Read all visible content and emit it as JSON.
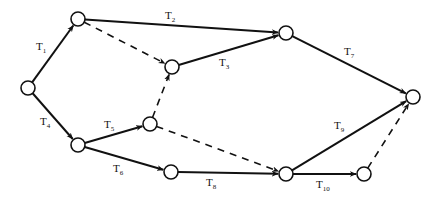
{
  "diagram": {
    "type": "activity-network",
    "nodes": [
      {
        "id": "n1",
        "x": 28,
        "y": 88
      },
      {
        "id": "n2",
        "x": 78,
        "y": 19
      },
      {
        "id": "n3",
        "x": 172,
        "y": 67
      },
      {
        "id": "n4",
        "x": 286,
        "y": 33
      },
      {
        "id": "n5",
        "x": 413,
        "y": 97
      },
      {
        "id": "n6",
        "x": 150,
        "y": 124
      },
      {
        "id": "n7",
        "x": 78,
        "y": 145
      },
      {
        "id": "n8",
        "x": 171,
        "y": 172
      },
      {
        "id": "n9",
        "x": 286,
        "y": 174
      },
      {
        "id": "n10",
        "x": 364,
        "y": 174
      }
    ],
    "edges": [
      {
        "from": "n1",
        "to": "n2",
        "style": "solid",
        "label": "T",
        "sub": "1",
        "lx": 36,
        "ly": 50
      },
      {
        "from": "n2",
        "to": "n4",
        "style": "solid",
        "label": "T",
        "sub": "2",
        "lx": 165,
        "ly": 19
      },
      {
        "from": "n3",
        "to": "n4",
        "style": "solid",
        "label": "T",
        "sub": "3",
        "lx": 219,
        "ly": 66
      },
      {
        "from": "n1",
        "to": "n7",
        "style": "solid",
        "label": "T",
        "sub": "4",
        "lx": 40,
        "ly": 125
      },
      {
        "from": "n7",
        "to": "n6",
        "style": "solid",
        "label": "T",
        "sub": "5",
        "lx": 104,
        "ly": 128
      },
      {
        "from": "n7",
        "to": "n8",
        "style": "solid",
        "label": "T",
        "sub": "6",
        "lx": 113,
        "ly": 172
      },
      {
        "from": "n4",
        "to": "n5",
        "style": "solid",
        "label": "T",
        "sub": "7",
        "lx": 344,
        "ly": 55
      },
      {
        "from": "n8",
        "to": "n9",
        "style": "solid",
        "label": "T",
        "sub": "8",
        "lx": 206,
        "ly": 186
      },
      {
        "from": "n9",
        "to": "n5",
        "style": "solid",
        "label": "T",
        "sub": "9",
        "lx": 334,
        "ly": 129
      },
      {
        "from": "n9",
        "to": "n10",
        "style": "solid",
        "label": "T",
        "sub": "10",
        "lx": 316,
        "ly": 188
      },
      {
        "from": "n2",
        "to": "n3",
        "style": "dashed"
      },
      {
        "from": "n6",
        "to": "n3",
        "style": "dashed"
      },
      {
        "from": "n6",
        "to": "n9",
        "style": "dashed"
      },
      {
        "from": "n10",
        "to": "n5",
        "style": "dashed"
      }
    ],
    "node_radius": 7,
    "colors": {
      "stroke": "#111111",
      "background": "#ffffff"
    }
  }
}
